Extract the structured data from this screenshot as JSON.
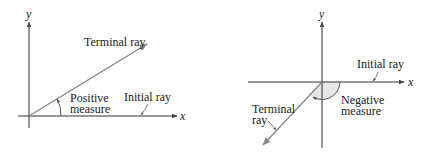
{
  "figure": {
    "left": {
      "title": "Positive angle",
      "axis_x_label": "x",
      "axis_y_label": "y",
      "terminal_label": "Terminal ray",
      "initial_label": "Initial ray",
      "measure_label_line1": "Positive",
      "measure_label_line2": "measure"
    },
    "right": {
      "title": "Negative angle",
      "axis_x_label": "x",
      "axis_y_label": "y",
      "terminal_label_line1": "Terminal",
      "terminal_label_line2": "ray",
      "initial_label": "Initial ray",
      "measure_label_line1": "Negative",
      "measure_label_line2": "measure"
    },
    "colors": {
      "axis": "#333333",
      "ray": "#8a8a8a",
      "shade": "#e6e6e6",
      "text": "#222222"
    }
  }
}
